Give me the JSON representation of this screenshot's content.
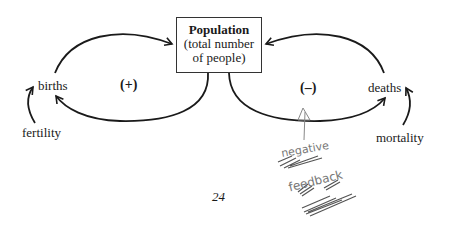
{
  "diagram": {
    "stock": {
      "title": "Population",
      "subtitle_line1": "(total number",
      "subtitle_line2": "of people)"
    },
    "left_loop": {
      "flow_label": "births",
      "polarity": "(+)",
      "driver": "fertility"
    },
    "right_loop": {
      "flow_label": "deaths",
      "polarity": "(–)",
      "driver": "mortality"
    },
    "annotation": {
      "handwritten_line1": "negative",
      "handwritten_line2": "feedback",
      "color": "#777777"
    },
    "page_number": "24"
  }
}
